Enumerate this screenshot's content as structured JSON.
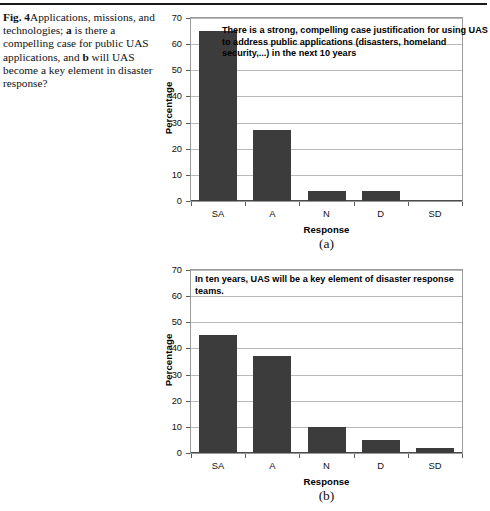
{
  "figure": {
    "caption_label": "Fig. 4",
    "caption_text_1": "Applications, missions, and technologies; ",
    "caption_bold_a": "a",
    "caption_text_2": " is there a compelling case for public UAS applications, and ",
    "caption_bold_b": "b",
    "caption_text_3": " will UAS become a key element in disaster response?"
  },
  "colors": {
    "bar_fill": "#3c3c3c",
    "gridline": "#b9b9b9",
    "frame": "#9a9a9a",
    "text": "#111111"
  },
  "panel_a": {
    "sub_caption": "(a)"
  },
  "panel_b": {
    "sub_caption": "(b)"
  },
  "chart_data": [
    {
      "type": "bar",
      "panel": "a",
      "title": "",
      "annotation": "There is a strong, compelling case justification for using UAS to address public applications (disasters, homeland security,...) in the next 10 years",
      "categories": [
        "SA",
        "A",
        "N",
        "D",
        "SD"
      ],
      "values": [
        65,
        27,
        4,
        4,
        0
      ],
      "xlabel": "Response",
      "ylabel": "Percentage",
      "ylim": [
        0,
        70
      ],
      "yticks": [
        0,
        10,
        20,
        30,
        40,
        50,
        60,
        70
      ],
      "grid": true,
      "legend": "none"
    },
    {
      "type": "bar",
      "panel": "b",
      "title": "",
      "annotation": "In ten years, UAS will be a key element of disaster response teams.",
      "categories": [
        "SA",
        "A",
        "N",
        "D",
        "SD"
      ],
      "values": [
        45,
        37,
        10,
        5,
        2
      ],
      "xlabel": "Response",
      "ylabel": "Percentage",
      "ylim": [
        0,
        70
      ],
      "yticks": [
        0,
        10,
        20,
        30,
        40,
        50,
        60,
        70
      ],
      "grid": true,
      "legend": "none"
    }
  ]
}
